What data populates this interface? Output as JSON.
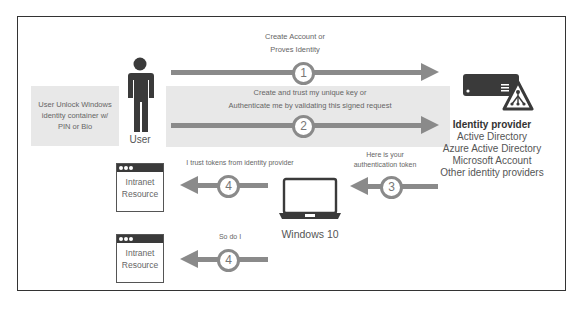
{
  "diagram": {
    "type": "Windows Hello authentication flow",
    "user": {
      "label": "User",
      "unlock_note": [
        "User Unlock Windows",
        "identity container w/",
        "PIN or Bio"
      ]
    },
    "steps": [
      {
        "number": "1",
        "direction": "right",
        "label_lines": [
          "Create Account or",
          "Proves Identity"
        ]
      },
      {
        "number": "2",
        "direction": "right",
        "label_lines": [
          "Create and trust my unique key or",
          "Authenticate me by validating this signed request"
        ]
      },
      {
        "number": "3",
        "direction": "left",
        "label_lines": [
          "Here is your",
          "authentication token"
        ]
      },
      {
        "number": "4",
        "direction": "left",
        "label_lines": [
          "I trust tokens from identity provider"
        ]
      },
      {
        "number": "4",
        "direction": "left",
        "label_lines": [
          "So do I"
        ]
      }
    ],
    "identity_provider": {
      "title": "Identity provider",
      "items": [
        "Active Directory",
        "Azure Active Directory",
        "Microsoft Account",
        "Other identity providers"
      ]
    },
    "device": {
      "label": "Windows 10"
    },
    "resources": [
      {
        "label_lines": [
          "Intranet",
          "Resource"
        ]
      },
      {
        "label_lines": [
          "Intranet",
          "Resource"
        ]
      }
    ],
    "colors": {
      "arrow": "#8a8a8a",
      "shade": "#e8e8e8",
      "icon_dark": "#3a3a3a",
      "border": "#333333"
    }
  }
}
